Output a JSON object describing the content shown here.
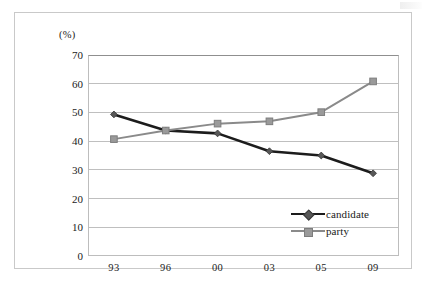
{
  "figure": {
    "unit_label": "(%)"
  },
  "legend": {
    "position": "inside-lower-right",
    "items": [
      {
        "label": "candidate",
        "color": "#1c1c1c",
        "marker": "diamond"
      },
      {
        "label": "party",
        "color": "#8a8a8a",
        "marker": "square"
      }
    ]
  },
  "chart_data": {
    "type": "line",
    "title": "",
    "subtitle": "",
    "xlabel": "",
    "ylabel": "(%)",
    "categories": [
      "93",
      "96",
      "00",
      "03",
      "05",
      "09"
    ],
    "x": [
      "93",
      "96",
      "00",
      "03",
      "05",
      "09"
    ],
    "ylim": [
      0,
      70
    ],
    "yticks": [
      0,
      10,
      20,
      30,
      40,
      50,
      60,
      70
    ],
    "ytick_labels": [
      "0",
      "10",
      "20",
      "30",
      "40",
      "50",
      "60",
      "70"
    ],
    "grid": "horizontal",
    "legend_position": "inside lower right",
    "series": [
      {
        "name": "candidate",
        "color": "#1c1c1c",
        "marker": "diamond",
        "values": [
          49.3,
          43.7,
          42.7,
          36.5,
          35.0,
          28.8
        ]
      },
      {
        "name": "party",
        "color": "#8a8a8a",
        "marker": "square",
        "values": [
          40.7,
          43.7,
          46.1,
          46.9,
          50.1,
          60.8
        ]
      }
    ]
  }
}
